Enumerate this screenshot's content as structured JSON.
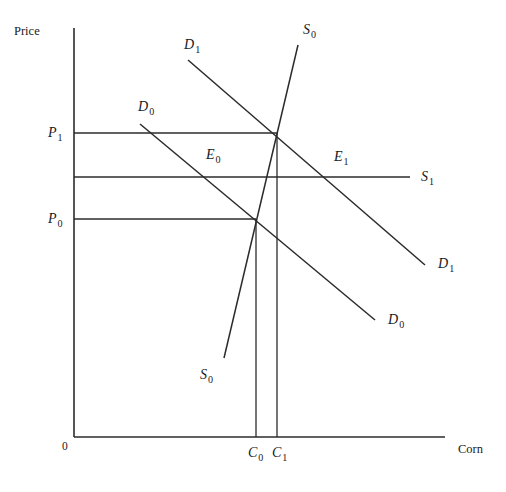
{
  "figure": {
    "type": "economics-supply-demand-diagram",
    "width": 506,
    "height": 492,
    "background_color": "#ffffff",
    "line_color": "#2b2b2b",
    "text_color": "#1a1a1a"
  },
  "axes": {
    "y_axis_label": "Price",
    "x_axis_label": "Corn",
    "origin_label": "0",
    "y_axis_x": 74,
    "y_axis_top": 28,
    "y_axis_bottom": 437,
    "x_axis_right": 445
  },
  "price_labels": [
    {
      "name": "P1",
      "base": "P",
      "sub": "1",
      "value_y": 133,
      "x": 48,
      "y": 126
    },
    {
      "name": "P0",
      "base": "P",
      "sub": "0",
      "value_y": 219,
      "x": 48,
      "y": 212
    }
  ],
  "quantity_labels": [
    {
      "name": "C0",
      "base": "C",
      "sub": "0",
      "value_x": 256,
      "x": 248,
      "y": 446
    },
    {
      "name": "C1",
      "base": "C",
      "sub": "1",
      "value_x": 277,
      "x": 272,
      "y": 446
    }
  ],
  "equilibria": [
    {
      "name": "E0",
      "base": "E",
      "sub": "0",
      "x": 206,
      "y": 148,
      "point_x": 256,
      "point_y": 219
    },
    {
      "name": "E1",
      "base": "E",
      "sub": "1",
      "x": 334,
      "y": 150,
      "point_x": 333,
      "point_y": 177
    }
  ],
  "curves": [
    {
      "name": "S0-supply-original",
      "base": "S",
      "sub": "0",
      "kind": "supply",
      "x1": 224,
      "y1": 358,
      "x2": 298,
      "y2": 45,
      "labels": [
        {
          "x": 200,
          "y": 368
        },
        {
          "x": 303,
          "y": 23
        }
      ]
    },
    {
      "name": "S1-supply-new",
      "base": "S",
      "sub": "1",
      "kind": "supply-horizontal",
      "x1": 74,
      "y1": 177,
      "x2": 410,
      "y2": 177,
      "labels": [
        {
          "x": 421,
          "y": 170
        }
      ]
    },
    {
      "name": "D0-demand-original",
      "base": "D",
      "sub": "0",
      "kind": "demand",
      "x1": 140,
      "y1": 124,
      "x2": 375,
      "y2": 320,
      "labels": [
        {
          "x": 138,
          "y": 100
        },
        {
          "x": 388,
          "y": 313
        }
      ]
    },
    {
      "name": "D1-demand-new",
      "base": "D",
      "sub": "1",
      "kind": "demand",
      "x1": 188,
      "y1": 60,
      "x2": 425,
      "y2": 265,
      "labels": [
        {
          "x": 184,
          "y": 38
        },
        {
          "x": 438,
          "y": 257
        }
      ]
    }
  ],
  "guide_lines": {
    "horizontal": [
      {
        "name": "P1-guide",
        "from_x": 74,
        "to_x": 277,
        "y": 133
      },
      {
        "name": "S1-guide",
        "from_x": 74,
        "to_x": 410,
        "y": 177
      },
      {
        "name": "P0-guide",
        "from_x": 74,
        "to_x": 256,
        "y": 219
      }
    ],
    "vertical": [
      {
        "name": "C0-dropline",
        "x": 256,
        "from_y": 219,
        "to_y": 437
      },
      {
        "name": "C1-dropline",
        "x": 277,
        "from_y": 133,
        "to_y": 437
      }
    ]
  },
  "chart_data": {
    "type": "line",
    "title": "",
    "xlabel": "Corn",
    "ylabel": "Price",
    "grid": false,
    "legend": "inline-curve-labels",
    "series": [
      {
        "name": "S0",
        "role": "supply, upward sloping",
        "points": [
          [
            224,
            358
          ],
          [
            298,
            45
          ]
        ]
      },
      {
        "name": "S1",
        "role": "supply, perfectly elastic (horizontal)",
        "points": [
          [
            74,
            177
          ],
          [
            410,
            177
          ]
        ]
      },
      {
        "name": "D0",
        "role": "demand, downward sloping",
        "points": [
          [
            140,
            124
          ],
          [
            375,
            320
          ]
        ]
      },
      {
        "name": "D1",
        "role": "demand, shifted right",
        "points": [
          [
            188,
            60
          ],
          [
            425,
            265
          ]
        ]
      }
    ],
    "annotations": [
      {
        "label": "E0",
        "description": "equilibrium of D0 and S0 at price P0, quantity C0"
      },
      {
        "label": "E1",
        "description": "equilibrium of D1 and S1 at price S1 level, quantity beyond C1"
      },
      {
        "label": "P0",
        "description": "original price level"
      },
      {
        "label": "P1",
        "description": "higher price level where S0 meets D1"
      },
      {
        "label": "C0",
        "description": "original quantity of corn"
      },
      {
        "label": "C1",
        "description": "quantity of corn at P1"
      }
    ]
  }
}
